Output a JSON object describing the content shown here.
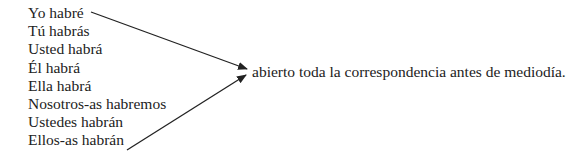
{
  "subjects": [
    "Yo habré",
    "Tú habrás",
    "Usted habrá",
    "Él habrá",
    "Ella habrá",
    "Nosotros-as habremos",
    "Ustedes habrán",
    "Ellos-as habrán"
  ],
  "predicate": "abierto toda la correspondencia antes de mediodía.",
  "arrows": [
    {
      "from": "Yo habré",
      "to": "predicate"
    },
    {
      "from": "Ellos-as habrán",
      "to": "predicate"
    }
  ],
  "colors": {
    "text": "#222222",
    "arrow": "#222222"
  }
}
